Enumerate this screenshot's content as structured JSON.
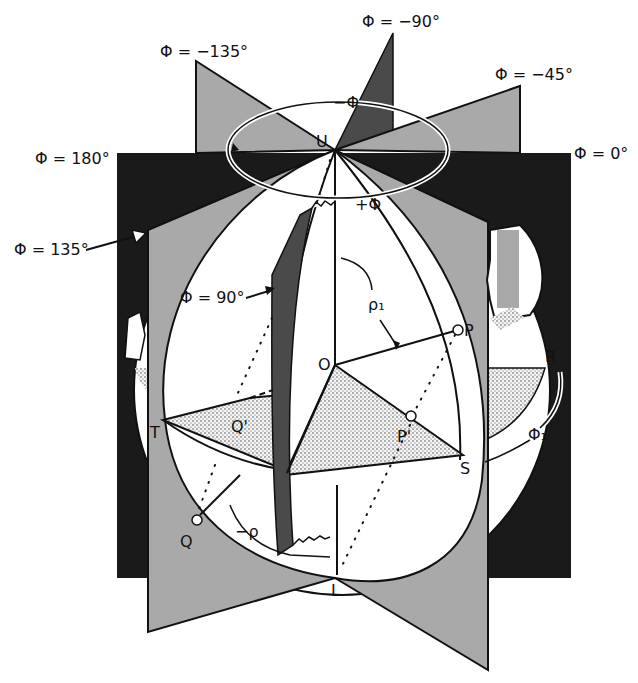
{
  "figure": {
    "colors": {
      "black_plane": "#1a1a1a",
      "gray_plane": "#a9a9a9",
      "dark_plane": "#4a4a4a",
      "sphere": "#ffffff",
      "stipple": "#cfcfcf"
    }
  },
  "phi_labels": {
    "m135": "Φ  =  −135°",
    "m90": "Φ  =  −90°",
    "m45": "Φ  =  −45°",
    "p180": "Φ  =  180°",
    "zero": "Φ  =  0°",
    "p135": "Φ  =  135°",
    "p90": "Φ  =  90°"
  },
  "rotation_labels": {
    "minus_phi": "−Φ",
    "plus_phi": "+Φ"
  },
  "points": {
    "U": "U",
    "O": "O",
    "P": "P",
    "P_prime": "P'",
    "Q": "Q",
    "Q_prime": "Q'",
    "R": "R",
    "S": "S",
    "T": "T",
    "L": "L"
  },
  "angles": {
    "rho1": "ρ₁",
    "minus_rho": "−ρ",
    "phi1": "Φ₁"
  }
}
